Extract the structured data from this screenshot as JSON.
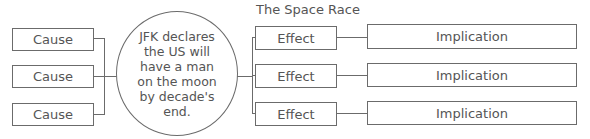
{
  "title": "The Space Race",
  "center": {
    "text": "JFK declares the US will have a man on the moon by decade's end."
  },
  "causes": [
    {
      "label": "Cause"
    },
    {
      "label": "Cause"
    },
    {
      "label": "Cause"
    }
  ],
  "effects": [
    {
      "label": "Effect",
      "implication": "Implication"
    },
    {
      "label": "Effect",
      "implication": "Implication"
    },
    {
      "label": "Effect",
      "implication": "Implication"
    }
  ],
  "colors": {
    "line": "#6b6b6b",
    "text": "#555555",
    "background": "#ffffff"
  }
}
